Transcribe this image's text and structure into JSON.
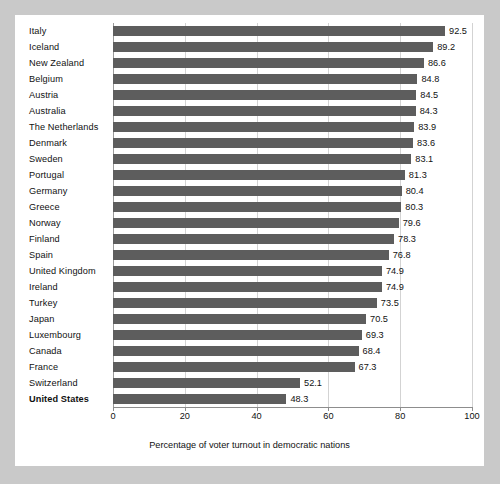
{
  "chart_data": {
    "type": "bar",
    "orientation": "horizontal",
    "title": "",
    "xlabel": "Percentage of voter turnout in democratic nations",
    "ylabel": "",
    "xlim": [
      0,
      100
    ],
    "xticks": [
      0,
      20,
      40,
      60,
      80,
      100
    ],
    "xtick_labels": [
      "0",
      "20",
      "40",
      "60",
      "80",
      "100"
    ],
    "grid": true,
    "legend": false,
    "bar_color": "#5d5d5d",
    "background_color": "#c9c9c9",
    "panel_color": "#ffffff",
    "highlight_category": "United States",
    "categories": [
      "Italy",
      "Iceland",
      "New Zealand",
      "Belgium",
      "Austria",
      "Australia",
      "The Netherlands",
      "Denmark",
      "Sweden",
      "Portugal",
      "Germany",
      "Greece",
      "Norway",
      "Finland",
      "Spain",
      "United Kingdom",
      "Ireland",
      "Turkey",
      "Japan",
      "Luxembourg",
      "Canada",
      "France",
      "Switzerland",
      "United States"
    ],
    "values": [
      92.5,
      89.2,
      86.6,
      84.8,
      84.5,
      84.3,
      83.9,
      83.6,
      83.1,
      81.3,
      80.4,
      80.3,
      79.6,
      78.3,
      76.8,
      74.9,
      74.9,
      73.5,
      70.5,
      69.3,
      68.4,
      67.3,
      52.1,
      48.3
    ],
    "value_labels": [
      "92.5",
      "89.2",
      "86.6",
      "84.8",
      "84.5",
      "84.3",
      "83.9",
      "83.6",
      "83.1",
      "81.3",
      "80.4",
      "80.3",
      "79.6",
      "78.3",
      "76.8",
      "74.9",
      "74.9",
      "73.5",
      "70.5",
      "69.3",
      "68.4",
      "67.3",
      "52.1",
      "48.3"
    ]
  }
}
